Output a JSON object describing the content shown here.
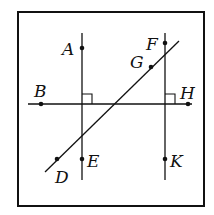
{
  "diagram": {
    "frame": {
      "x": 18,
      "y": 12,
      "w": 186,
      "h": 194
    },
    "lines": [
      {
        "id": "vertical-left",
        "x1": 82,
        "y1": 33,
        "x2": 82,
        "y2": 180
      },
      {
        "id": "vertical-right",
        "x1": 165,
        "y1": 33,
        "x2": 165,
        "y2": 180
      },
      {
        "id": "horizontal",
        "x1": 28,
        "y1": 104,
        "x2": 192,
        "y2": 104
      },
      {
        "id": "transversal",
        "x1": 45,
        "y1": 172,
        "x2": 179,
        "y2": 41
      }
    ],
    "right_angles": [
      {
        "at": "left",
        "x": 82,
        "y": 104
      },
      {
        "at": "right",
        "x": 165,
        "y": 104
      }
    ],
    "points": [
      {
        "label": "A",
        "x": 82,
        "y": 48,
        "lx": 62,
        "ly": 55
      },
      {
        "label": "F",
        "x": 165,
        "y": 43,
        "lx": 146,
        "ly": 50
      },
      {
        "label": "G",
        "x": 151,
        "y": 67,
        "lx": 130,
        "ly": 68
      },
      {
        "label": "B",
        "x": 41,
        "y": 104,
        "lx": 34,
        "ly": 97
      },
      {
        "label": "H",
        "x": 188,
        "y": 104,
        "lx": 180,
        "ly": 99
      },
      {
        "label": "D",
        "x": 57,
        "y": 159,
        "lx": 55,
        "ly": 183
      },
      {
        "label": "E",
        "x": 82,
        "y": 159,
        "lx": 87,
        "ly": 167
      },
      {
        "label": "K",
        "x": 165,
        "y": 159,
        "lx": 170,
        "ly": 167
      }
    ]
  }
}
